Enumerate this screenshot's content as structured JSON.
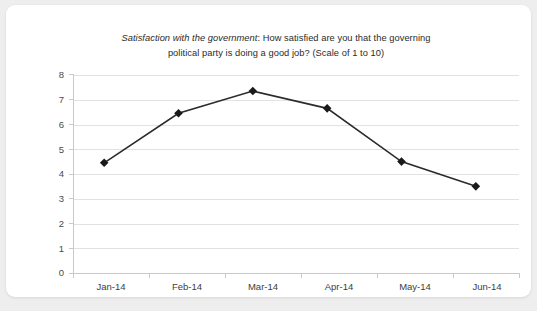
{
  "card": {
    "background_color": "#ffffff",
    "page_background_color": "#eeeeee"
  },
  "chart_data": {
    "type": "line",
    "title": "Satisfaction with the government: How satisfied are you that the governing political party is doing a good job? (Scale of 1 to 10)",
    "title_line_1_italic": "Satisfaction with the government",
    "title_line_1_rest": ": How satisfied are you that the governing",
    "title_line_2": "political party is doing a good job? (Scale of 1 to 10)",
    "subtitle": "",
    "xlabel": "",
    "ylabel": "",
    "categories": [
      "Jan-14",
      "Feb-14",
      "Mar-14",
      "Apr-14",
      "May-14",
      "Jun-14"
    ],
    "values": [
      4.25,
      6.25,
      7.15,
      6.45,
      4.3,
      3.3
    ],
    "series": [
      {
        "name": "Satisfaction with the government",
        "values": [
          4.25,
          6.25,
          7.15,
          6.45,
          4.3,
          3.3
        ],
        "line_color": "#2b2b2b",
        "marker": "diamond",
        "marker_color": "#1a1a1a"
      }
    ],
    "ylim": [
      0,
      8
    ],
    "yticks": [
      0,
      1,
      2,
      3,
      4,
      5,
      6,
      7,
      8
    ],
    "ytick_labels": [
      "0",
      "1",
      "2",
      "3",
      "4",
      "5",
      "6",
      "7",
      "8"
    ],
    "grid": true,
    "grid_axis": "y",
    "grid_color": "#e2e2e2",
    "legend": false,
    "legend_position": "none",
    "annotations": []
  }
}
